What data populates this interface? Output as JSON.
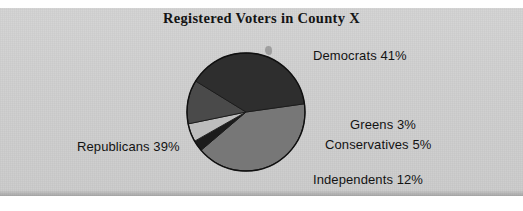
{
  "figure": {
    "background_color": "#cfcfcf",
    "page_color": "#ffffff"
  },
  "chart_data": {
    "type": "pie",
    "title": "Registered Voters in County X",
    "xlabel": "",
    "ylabel": "",
    "legend_position": "none",
    "labels_outside": true,
    "categories": [
      "Democrats",
      "Republicans",
      "Independents",
      "Conservatives",
      "Greens"
    ],
    "values": [
      41,
      39,
      12,
      5,
      3
    ],
    "units": "percent",
    "total": 100,
    "start_angle_deg": -8,
    "direction": "clockwise",
    "slices": [
      {
        "name": "Democrats",
        "value": 41,
        "label": "Democrats 41%",
        "color": "#777777",
        "start_deg": -8,
        "sweep_deg": 147.6
      },
      {
        "name": "Greens",
        "value": 3,
        "label": "Greens 3%",
        "color": "#1c1c1c",
        "start_deg": 139.6,
        "sweep_deg": 10.8
      },
      {
        "name": "Conservatives",
        "value": 5,
        "label": "Conservatives 5%",
        "color": "#bdbdbd",
        "start_deg": 150.4,
        "sweep_deg": 18.0
      },
      {
        "name": "Independents",
        "value": 12,
        "label": "Independents 12%",
        "color": "#4a4a4a",
        "start_deg": 168.4,
        "sweep_deg": 43.2
      },
      {
        "name": "Republicans",
        "value": 39,
        "label": "Republicans 39%",
        "color": "#2e2e2e",
        "start_deg": 211.6,
        "sweep_deg": 140.4
      }
    ]
  }
}
